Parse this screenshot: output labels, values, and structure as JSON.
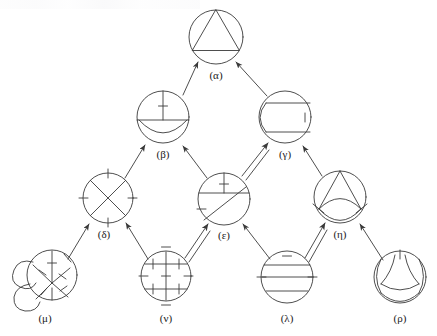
{
  "figure": {
    "type": "hasse-lattice-diagram",
    "background_color": "#ffffff",
    "stroke_color": "#3a3a3a",
    "label_color": "#1a1a1a",
    "width": 437,
    "height": 336,
    "top_artifact_present": true,
    "levels": 4
  },
  "nodes": [
    {
      "id": "alpha",
      "label": "(α)",
      "level": 1,
      "cx": 216,
      "cy": 37,
      "r": 27,
      "label_x": 216,
      "label_y": 79,
      "content": "circle with inscribed triangle"
    },
    {
      "id": "beta",
      "label": "(β)",
      "level": 2,
      "cx": 163,
      "cy": 117,
      "r": 26,
      "label_x": 163,
      "label_y": 158,
      "content": "vertical chord with tick, horizontal diameter, lower arc"
    },
    {
      "id": "gamma",
      "label": "(γ)",
      "level": 2,
      "cx": 285,
      "cy": 117,
      "r": 26,
      "label_x": 285,
      "label_y": 158,
      "content": "two horizontal chords joined by left arc, right tick"
    },
    {
      "id": "delta",
      "label": "(δ)",
      "level": 3,
      "cx": 108,
      "cy": 198,
      "r": 25,
      "label_x": 104,
      "label_y": 238,
      "content": "crossing diagonals with four ticks N S E W"
    },
    {
      "id": "epsilon",
      "label": "(ε)",
      "level": 3,
      "cx": 224,
      "cy": 199,
      "r": 26,
      "label_x": 224,
      "label_y": 239,
      "content": "vertical tick, horizontal chord, diagonal chord, left tick"
    },
    {
      "id": "eta",
      "label": "(η)",
      "level": 3,
      "cx": 340,
      "cy": 197,
      "r": 26,
      "label_x": 340,
      "label_y": 238,
      "content": "apex lines forming triangle top with lens shape below and side ticks"
    },
    {
      "id": "mu",
      "label": "(μ)",
      "level": 4,
      "cx": 49,
      "cy": 277,
      "r": 26,
      "label_x": 45,
      "label_y": 322,
      "content": "overlapping blobs on left with branching ticked chords"
    },
    {
      "id": "nu",
      "label": "(ν)",
      "level": 4,
      "cx": 166,
      "cy": 276,
      "r": 25,
      "label_x": 166,
      "label_y": 322,
      "content": "vertical chord and two horizontal chords with eight ticks"
    },
    {
      "id": "lambda",
      "label": "(λ)",
      "level": 4,
      "cx": 287,
      "cy": 277,
      "r": 26,
      "label_x": 287,
      "label_y": 322,
      "content": "three horizontal chords with top and side ticks"
    },
    {
      "id": "rho",
      "label": "(ρ)",
      "level": 4,
      "cx": 400,
      "cy": 277,
      "r": 26,
      "label_x": 400,
      "label_y": 322,
      "content": "three-fold curved arcs with top tick"
    }
  ],
  "edges": [
    {
      "id": "beta-alpha",
      "from": "beta",
      "to": "alpha",
      "style": "single"
    },
    {
      "id": "gamma-alpha",
      "from": "gamma",
      "to": "alpha",
      "style": "single"
    },
    {
      "id": "delta-beta",
      "from": "delta",
      "to": "beta",
      "style": "single"
    },
    {
      "id": "epsilon-beta",
      "from": "epsilon",
      "to": "beta",
      "style": "single"
    },
    {
      "id": "epsilon-gamma",
      "from": "epsilon",
      "to": "gamma",
      "style": "double"
    },
    {
      "id": "eta-gamma",
      "from": "eta",
      "to": "gamma",
      "style": "single"
    },
    {
      "id": "mu-delta",
      "from": "mu",
      "to": "delta",
      "style": "single"
    },
    {
      "id": "nu-delta",
      "from": "nu",
      "to": "delta",
      "style": "single"
    },
    {
      "id": "nu-epsilon",
      "from": "nu",
      "to": "epsilon",
      "style": "double"
    },
    {
      "id": "lambda-epsilon",
      "from": "lambda",
      "to": "epsilon",
      "style": "single"
    },
    {
      "id": "lambda-eta",
      "from": "lambda",
      "to": "eta",
      "style": "double"
    },
    {
      "id": "rho-eta",
      "from": "rho",
      "to": "eta",
      "style": "single"
    }
  ]
}
